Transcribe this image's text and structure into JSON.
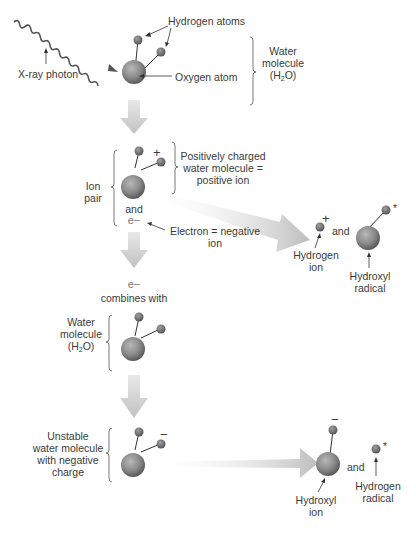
{
  "colors": {
    "atom_fill": "#8a8a8a",
    "arrow_fill": "#c4c4c4",
    "text": "#3a3a3a",
    "line": "#333333"
  },
  "step1": {
    "photon_label": "X-ray photon",
    "hydrogen_label": "Hydrogen atoms",
    "oxygen_label": "Oxygen atom",
    "molecule_label_line1": "Water",
    "molecule_label_line2": "molecule",
    "molecule_label_line3_pre": "(H",
    "molecule_label_line3_sub": "2",
    "molecule_label_line3_post": "O)"
  },
  "step2": {
    "ion_pair_line1": "Ion",
    "ion_pair_line2": "pair",
    "plus_sign": "+",
    "positive_label_line1": "Positively charged",
    "positive_label_line2": "water molecule =",
    "positive_label_line3": "positive ion",
    "and_label": "and",
    "electron_symbol": "e−",
    "electron_label_line1": "Electron = negative",
    "electron_label_line2": "ion",
    "products": {
      "plus_sign": "+",
      "hydrogen_ion_line1": "Hydrogen",
      "hydrogen_ion_line2": "ion",
      "and_label": "and",
      "radical_star": "*",
      "hydroxyl_radical_line1": "Hydroxyl",
      "hydroxyl_radical_line2": "radical"
    }
  },
  "step3": {
    "electron_symbol": "e−",
    "combines_label": "combines with",
    "molecule_label_line1": "Water",
    "molecule_label_line2": "molecule",
    "molecule_label_line3_pre": "(H",
    "molecule_label_line3_sub": "2",
    "molecule_label_line3_post": "O)"
  },
  "step4": {
    "unstable_line1": "Unstable",
    "unstable_line2": "water molecule",
    "unstable_line3": "with negative",
    "unstable_line4": "charge",
    "minus_sign": "−",
    "products": {
      "minus_sign": "−",
      "hydroxyl_ion_line1": "Hydroxyl",
      "hydroxyl_ion_line2": "ion",
      "and_label": "and",
      "radical_star": "*",
      "hydrogen_radical_line1": "Hydrogen",
      "hydrogen_radical_line2": "radical"
    }
  }
}
